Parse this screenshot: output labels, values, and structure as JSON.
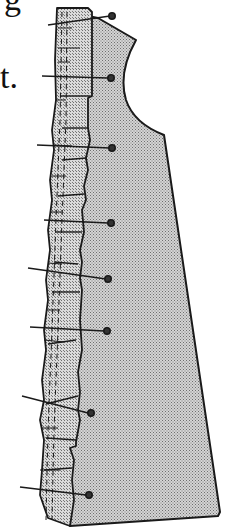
{
  "illustration": {
    "subject": "garment pattern piece with gathered ruffle pinned along front edge",
    "text_fragments": [
      {
        "id": "frag-g",
        "text": "g"
      },
      {
        "id": "frag-t",
        "text": "t."
      }
    ],
    "pins_count": 8,
    "colors": {
      "fabric_fill": "#b8b8b8",
      "ruffle_fill": "#c4c4c4",
      "outline": "#1a1a1a",
      "background": "#ffffff"
    }
  }
}
